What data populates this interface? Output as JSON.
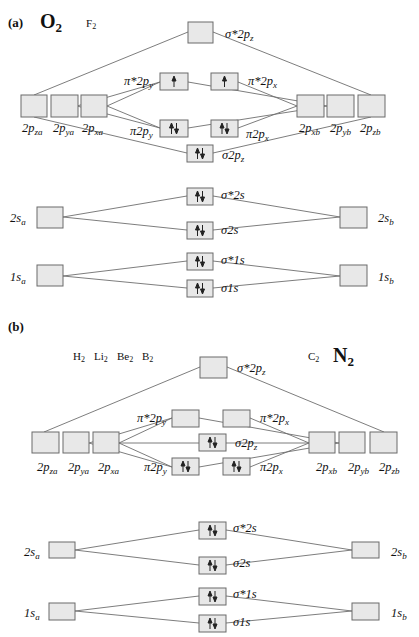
{
  "panels": [
    {
      "id": "a",
      "label": "(a)",
      "molecules": [
        {
          "text": "O",
          "sub": "2",
          "size": "big",
          "x": 40,
          "y": 28
        },
        {
          "text": "F",
          "sub": "2",
          "size": "small",
          "x": 86,
          "y": 27
        }
      ],
      "boxes": [
        {
          "id": "sigma_star_2pz",
          "x": 188,
          "y": 22,
          "w": 25,
          "h": 21,
          "electrons": "",
          "label": "σ*2pz",
          "lx": 225,
          "ly": 38
        },
        {
          "id": "2pza",
          "x": 21,
          "y": 95,
          "w": 26,
          "h": 22,
          "electrons": "",
          "label": "2pza",
          "lx": 22,
          "ly": 132
        },
        {
          "id": "2pya",
          "x": 51,
          "y": 95,
          "w": 27,
          "h": 22,
          "electrons": "",
          "label": "2pya",
          "lx": 53,
          "ly": 132
        },
        {
          "id": "2pxa",
          "x": 81,
          "y": 95,
          "w": 26,
          "h": 22,
          "electrons": "",
          "label": "2pxa",
          "lx": 82,
          "ly": 132
        },
        {
          "id": "pi_star_2py",
          "x": 160,
          "y": 73,
          "w": 28,
          "h": 17,
          "electrons": "up",
          "label": "π*2py",
          "lx": 124,
          "ly": 85
        },
        {
          "id": "pi_star_2px",
          "x": 211,
          "y": 73,
          "w": 27,
          "h": 17,
          "electrons": "up",
          "label": "π*2px",
          "lx": 248,
          "ly": 85
        },
        {
          "id": "pi_2py",
          "x": 160,
          "y": 120,
          "w": 28,
          "h": 17,
          "electrons": "pair",
          "label": "π2py",
          "lx": 130,
          "ly": 135
        },
        {
          "id": "pi_2px",
          "x": 211,
          "y": 120,
          "w": 27,
          "h": 17,
          "electrons": "pair",
          "label": "π2px",
          "lx": 246,
          "ly": 138
        },
        {
          "id": "sigma_2pz",
          "x": 187,
          "y": 145,
          "w": 26,
          "h": 17,
          "electrons": "pair",
          "label": "σ2pz",
          "lx": 222,
          "ly": 159
        },
        {
          "id": "2pxb",
          "x": 297,
          "y": 95,
          "w": 27,
          "h": 22,
          "electrons": "",
          "label": "2pxb",
          "lx": 299,
          "ly": 132
        },
        {
          "id": "2pyb",
          "x": 327,
          "y": 95,
          "w": 27,
          "h": 22,
          "electrons": "",
          "label": "2pyb",
          "lx": 330,
          "ly": 132
        },
        {
          "id": "2pzb",
          "x": 358,
          "y": 95,
          "w": 27,
          "h": 22,
          "electrons": "",
          "label": "2pzb",
          "lx": 360,
          "ly": 132
        },
        {
          "id": "sigma_star_2s",
          "x": 187,
          "y": 188,
          "w": 26,
          "h": 17,
          "electrons": "pair",
          "label": "σ*2s",
          "lx": 221,
          "ly": 199
        },
        {
          "id": "sigma_2s",
          "x": 187,
          "y": 222,
          "w": 26,
          "h": 17,
          "electrons": "pair",
          "label": "σ2s",
          "lx": 221,
          "ly": 234
        },
        {
          "id": "2sa",
          "x": 37,
          "y": 207,
          "w": 26,
          "h": 21,
          "electrons": "",
          "label": "2sa",
          "lx": 10,
          "ly": 222
        },
        {
          "id": "2sb",
          "x": 340,
          "y": 207,
          "w": 27,
          "h": 21,
          "electrons": "",
          "label": "2sb",
          "lx": 378,
          "ly": 222
        },
        {
          "id": "sigma_star_1s",
          "x": 187,
          "y": 253,
          "w": 26,
          "h": 17,
          "electrons": "pair",
          "label": "σ*1s",
          "lx": 221,
          "ly": 264
        },
        {
          "id": "sigma_1s",
          "x": 187,
          "y": 280,
          "w": 26,
          "h": 17,
          "electrons": "pair",
          "label": "σ1s",
          "lx": 221,
          "ly": 292
        },
        {
          "id": "1sa",
          "x": 37,
          "y": 265,
          "w": 26,
          "h": 21,
          "electrons": "",
          "label": "1sa",
          "lx": 10,
          "ly": 281
        },
        {
          "id": "1sb",
          "x": 340,
          "y": 265,
          "w": 27,
          "h": 21,
          "electrons": "",
          "label": "1sb",
          "lx": 378,
          "ly": 281
        }
      ],
      "lines": [
        [
          34,
          95,
          188,
          32
        ],
        [
          371,
          95,
          213,
          32
        ],
        [
          77,
          106,
          160,
          82
        ],
        [
          77,
          106,
          160,
          128
        ],
        [
          107,
          106,
          160,
          82
        ],
        [
          107,
          106,
          160,
          128
        ],
        [
          34,
          117,
          187,
          153
        ],
        [
          371,
          117,
          213,
          153
        ],
        [
          188,
          82,
          327,
          106
        ],
        [
          188,
          128,
          327,
          106
        ],
        [
          238,
          82,
          297,
          106
        ],
        [
          238,
          128,
          297,
          106
        ],
        [
          63,
          217,
          187,
          196
        ],
        [
          63,
          217,
          187,
          230
        ],
        [
          340,
          217,
          213,
          196
        ],
        [
          340,
          217,
          213,
          230
        ],
        [
          63,
          276,
          187,
          261
        ],
        [
          63,
          276,
          187,
          288
        ],
        [
          340,
          276,
          213,
          261
        ],
        [
          340,
          276,
          213,
          288
        ]
      ]
    },
    {
      "id": "b",
      "label": "(b)",
      "molecules": [
        {
          "text": "H",
          "sub": "2",
          "size": "small",
          "x": 73,
          "y": 360
        },
        {
          "text": "Li",
          "sub": "2",
          "size": "small",
          "x": 94,
          "y": 360
        },
        {
          "text": "Be",
          "sub": "2",
          "size": "small",
          "x": 117,
          "y": 360
        },
        {
          "text": "B",
          "sub": "2",
          "size": "small",
          "x": 142,
          "y": 360
        },
        {
          "text": "C",
          "sub": "2",
          "size": "small",
          "x": 308,
          "y": 360
        },
        {
          "text": "N",
          "sub": "2",
          "size": "big",
          "x": 333,
          "y": 362
        }
      ],
      "boxes": [
        {
          "id": "sigma_star_2pz",
          "x": 200,
          "y": 357,
          "w": 27,
          "h": 21,
          "electrons": "",
          "label": "σ*2pz",
          "lx": 237,
          "ly": 372
        },
        {
          "id": "2pza",
          "x": 32,
          "y": 432,
          "w": 27,
          "h": 21,
          "electrons": "",
          "label": "2pza",
          "lx": 37,
          "ly": 471
        },
        {
          "id": "2pya",
          "x": 63,
          "y": 432,
          "w": 26,
          "h": 21,
          "electrons": "",
          "label": "2pya",
          "lx": 68,
          "ly": 471
        },
        {
          "id": "2pxa",
          "x": 93,
          "y": 432,
          "w": 26,
          "h": 21,
          "electrons": "",
          "label": "2pxa",
          "lx": 98,
          "ly": 471
        },
        {
          "id": "pi_star_2py",
          "x": 172,
          "y": 410,
          "w": 27,
          "h": 17,
          "electrons": "",
          "label": "π*2py",
          "lx": 137,
          "ly": 422
        },
        {
          "id": "pi_star_2px",
          "x": 223,
          "y": 410,
          "w": 27,
          "h": 17,
          "electrons": "",
          "label": "π*2px",
          "lx": 260,
          "ly": 422
        },
        {
          "id": "sigma_2pz",
          "x": 199,
          "y": 434,
          "w": 27,
          "h": 17,
          "electrons": "pair",
          "label": "σ2pz",
          "lx": 235,
          "ly": 447
        },
        {
          "id": "pi_2py",
          "x": 172,
          "y": 458,
          "w": 27,
          "h": 17,
          "electrons": "pair",
          "label": "π2py",
          "lx": 144,
          "ly": 471
        },
        {
          "id": "pi_2px",
          "x": 223,
          "y": 458,
          "w": 27,
          "h": 17,
          "electrons": "pair",
          "label": "π2px",
          "lx": 260,
          "ly": 471
        },
        {
          "id": "2pxb",
          "x": 309,
          "y": 432,
          "w": 26,
          "h": 21,
          "electrons": "",
          "label": "2pxb",
          "lx": 316,
          "ly": 471
        },
        {
          "id": "2pyb",
          "x": 339,
          "y": 432,
          "w": 26,
          "h": 21,
          "electrons": "",
          "label": "2pyb",
          "lx": 348,
          "ly": 471
        },
        {
          "id": "2pzb",
          "x": 370,
          "y": 432,
          "w": 27,
          "h": 21,
          "electrons": "",
          "label": "2pzb",
          "lx": 379,
          "ly": 471
        },
        {
          "id": "sigma_star_2s",
          "x": 199,
          "y": 522,
          "w": 27,
          "h": 17,
          "electrons": "pair",
          "label": "σ*2s",
          "lx": 233,
          "ly": 532
        },
        {
          "id": "sigma_2s",
          "x": 199,
          "y": 557,
          "w": 27,
          "h": 17,
          "electrons": "pair",
          "label": "σ2s",
          "lx": 233,
          "ly": 567
        },
        {
          "id": "2sa",
          "x": 49,
          "y": 542,
          "w": 26,
          "h": 16,
          "electrons": "",
          "label": "2sa",
          "lx": 24,
          "ly": 556
        },
        {
          "id": "2sb",
          "x": 352,
          "y": 542,
          "w": 27,
          "h": 16,
          "electrons": "",
          "label": "2sb",
          "lx": 391,
          "ly": 556
        },
        {
          "id": "sigma_star_1s",
          "x": 199,
          "y": 588,
          "w": 27,
          "h": 17,
          "electrons": "pair",
          "label": "σ*1s",
          "lx": 233,
          "ly": 598
        },
        {
          "id": "sigma_1s",
          "x": 199,
          "y": 615,
          "w": 27,
          "h": 17,
          "electrons": "pair",
          "label": "σ1s",
          "lx": 233,
          "ly": 626
        },
        {
          "id": "1sa",
          "x": 49,
          "y": 603,
          "w": 26,
          "h": 17,
          "electrons": "",
          "label": "1sa",
          "lx": 24,
          "ly": 617
        },
        {
          "id": "1sb",
          "x": 352,
          "y": 603,
          "w": 27,
          "h": 17,
          "electrons": "",
          "label": "1sb",
          "lx": 391,
          "ly": 617
        }
      ],
      "lines": [
        [
          44,
          432,
          200,
          367
        ],
        [
          384,
          432,
          227,
          367
        ],
        [
          89,
          443,
          172,
          418
        ],
        [
          89,
          443,
          172,
          467
        ],
        [
          119,
          443,
          172,
          418
        ],
        [
          119,
          443,
          172,
          467
        ],
        [
          119,
          443,
          199,
          443
        ],
        [
          199,
          418,
          339,
          443
        ],
        [
          199,
          467,
          339,
          443
        ],
        [
          250,
          418,
          309,
          443
        ],
        [
          250,
          467,
          309,
          443
        ],
        [
          226,
          443,
          309,
          443
        ],
        [
          75,
          550,
          199,
          530
        ],
        [
          75,
          550,
          199,
          565
        ],
        [
          352,
          550,
          226,
          530
        ],
        [
          352,
          550,
          226,
          565
        ],
        [
          75,
          611,
          199,
          596
        ],
        [
          75,
          611,
          199,
          623
        ],
        [
          352,
          611,
          226,
          596
        ],
        [
          352,
          611,
          226,
          623
        ]
      ]
    }
  ],
  "panel_labels": [
    {
      "text": "(a)",
      "x": 8,
      "y": 27
    },
    {
      "text": "(b)",
      "x": 8,
      "y": 331
    }
  ]
}
